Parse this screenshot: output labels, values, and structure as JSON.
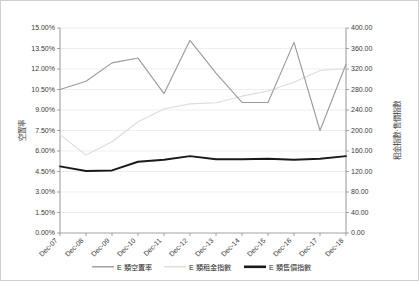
{
  "chart_data": {
    "type": "line",
    "title": "",
    "subtitle": "",
    "xlabel": "",
    "ylabel": "空置率",
    "y2label": "租金指數‧售價指數",
    "grid": true,
    "legend_position": "bottom",
    "categories": [
      "Dec-07",
      "Dec-08",
      "Dec-09",
      "Dec-10",
      "Dec-11",
      "Dec-12",
      "Dec-13",
      "Dec-14",
      "Dec-15",
      "Dec-16",
      "Dec-17",
      "Dec-18"
    ],
    "ylim": [
      0,
      15
    ],
    "yticks": [
      "0.00%",
      "1.50%",
      "3.00%",
      "4.50%",
      "6.00%",
      "7.50%",
      "9.00%",
      "10.50%",
      "12.00%",
      "13.50%",
      "15.00%"
    ],
    "ytick_values": [
      0,
      1.5,
      3.0,
      4.5,
      6.0,
      7.5,
      9.0,
      10.5,
      12.0,
      13.5,
      15.0
    ],
    "y2lim": [
      0,
      400
    ],
    "y2ticks": [
      "0.00",
      "40.00",
      "80.00",
      "120.00",
      "160.00",
      "200.00",
      "240.00",
      "280.00",
      "320.00",
      "360.00",
      "400.00"
    ],
    "y2tick_values": [
      0,
      40,
      80,
      120,
      160,
      200,
      240,
      280,
      320,
      360,
      400
    ],
    "series": [
      {
        "name": "E 類空置率",
        "axis": "left",
        "unit": "%",
        "color": "#9a9a9a",
        "width": 1.1,
        "values": [
          10.5,
          11.1,
          12.45,
          12.8,
          10.2,
          14.1,
          11.7,
          9.55,
          9.55,
          13.95,
          7.5,
          12.35
        ]
      },
      {
        "name": "E 類租金指數",
        "axis": "right",
        "unit": "",
        "color": "#dcdcdc",
        "width": 1.1,
        "values": [
          192,
          152,
          178,
          217,
          242,
          252,
          254,
          267,
          277,
          294,
          317,
          321
        ]
      },
      {
        "name": "E 類售價指數",
        "axis": "right",
        "unit": "",
        "color": "#1a1a1a",
        "width": 1.9,
        "values": [
          130,
          121,
          122,
          139,
          143,
          150,
          144,
          144,
          145,
          143,
          145,
          150
        ]
      }
    ]
  },
  "legend": {
    "items": [
      {
        "label": "E 類空置率",
        "color": "#9a9a9a",
        "thickness": 1.4
      },
      {
        "label": "E 類租金指數",
        "color": "#dcdcdc",
        "thickness": 1.4
      },
      {
        "label": "E 類售價指數",
        "color": "#1a1a1a",
        "thickness": 2.6
      }
    ]
  },
  "axes": {
    "left_title": "空置率",
    "right_title": "租金指數‧售價指數"
  },
  "colors": {
    "frame": "#cfcfcf",
    "grid": "#e6e6e6",
    "axis": "#8c8c8c",
    "text": "#3a3a3a"
  }
}
